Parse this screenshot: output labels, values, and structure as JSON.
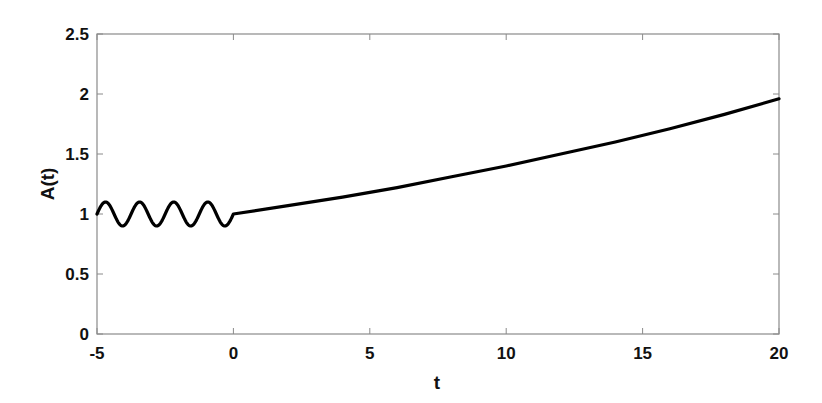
{
  "chart_data": {
    "type": "line",
    "title": "",
    "xlabel": "t",
    "ylabel": "A(t)",
    "xlim": [
      -5,
      20
    ],
    "ylim": [
      0,
      2.5
    ],
    "xticks": [
      -5,
      0,
      5,
      10,
      15,
      20
    ],
    "xtick_labels": [
      "-5",
      "0",
      "5",
      "10",
      "15",
      "20"
    ],
    "yticks": [
      0,
      0.5,
      1,
      1.5,
      2,
      2.5
    ],
    "ytick_labels": [
      "0",
      "0.5",
      "1",
      "1.5",
      "2",
      "2.5"
    ],
    "grid": false,
    "legend": null,
    "line_color": "#000000",
    "series": [
      {
        "name": "A(t)",
        "segments": [
          {
            "description": "oscillation for t in [-5, 0]: 1 + 0.1*sin(2*pi*(t+5)/1.25)",
            "x": [
              -5,
              -4.6875,
              -4.375,
              -4.0625,
              -3.75,
              -3.4375,
              -3.125,
              -2.8125,
              -2.5,
              -2.1875,
              -1.875,
              -1.5625,
              -1.25,
              -0.9375,
              -0.625,
              -0.3125,
              0
            ],
            "y": [
              1.0,
              1.1,
              1.0,
              0.9,
              1.0,
              1.1,
              1.0,
              0.9,
              1.0,
              1.1,
              1.0,
              0.9,
              1.0,
              1.1,
              1.0,
              0.9,
              1.0
            ]
          },
          {
            "description": "growth for t in [0, 20]: approx exp(0.0336 t)",
            "x": [
              0,
              2,
              4,
              6,
              8,
              10,
              12,
              14,
              16,
              18,
              20
            ],
            "y": [
              1.0,
              1.07,
              1.14,
              1.22,
              1.31,
              1.4,
              1.5,
              1.6,
              1.71,
              1.83,
              1.96
            ]
          }
        ]
      }
    ]
  }
}
